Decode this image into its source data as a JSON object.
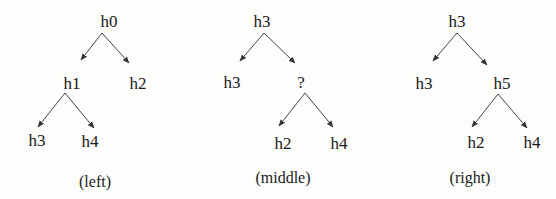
{
  "figure": {
    "panels": [
      {
        "caption": "(left)",
        "nodes": [
          {
            "id": "l-h0",
            "label": "h0"
          },
          {
            "id": "l-h1",
            "label": "h1"
          },
          {
            "id": "l-h2",
            "label": "h2"
          },
          {
            "id": "l-h3",
            "label": "h3"
          },
          {
            "id": "l-h4",
            "label": "h4"
          }
        ],
        "edges": [
          [
            "h0",
            "h1"
          ],
          [
            "h0",
            "h2"
          ],
          [
            "h1",
            "h3"
          ],
          [
            "h1",
            "h4"
          ]
        ]
      },
      {
        "caption": "(middle)",
        "nodes": [
          {
            "id": "m-root",
            "label": "h3"
          },
          {
            "id": "m-h3",
            "label": "h3"
          },
          {
            "id": "m-q",
            "label": "?"
          },
          {
            "id": "m-h2",
            "label": "h2"
          },
          {
            "id": "m-h4",
            "label": "h4"
          }
        ],
        "edges": [
          [
            "h3",
            "h3"
          ],
          [
            "h3",
            "?"
          ],
          [
            "?",
            "h2"
          ],
          [
            "?",
            "h4"
          ]
        ]
      },
      {
        "caption": "(right)",
        "nodes": [
          {
            "id": "r-root",
            "label": "h3"
          },
          {
            "id": "r-h3",
            "label": "h3"
          },
          {
            "id": "r-h5",
            "label": "h5"
          },
          {
            "id": "r-h2",
            "label": "h2"
          },
          {
            "id": "r-h4",
            "label": "h4"
          }
        ],
        "edges": [
          [
            "h3",
            "h3"
          ],
          [
            "h3",
            "h5"
          ],
          [
            "h5",
            "h2"
          ],
          [
            "h5",
            "h4"
          ]
        ]
      }
    ]
  }
}
